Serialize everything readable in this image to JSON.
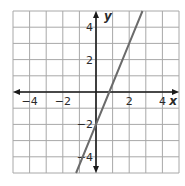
{
  "chart_data": {
    "type": "line",
    "title": "",
    "xlabel": "x",
    "ylabel": "y",
    "xlim": [
      -5,
      5
    ],
    "ylim": [
      -5,
      5
    ],
    "grid": true,
    "x_ticks": [
      -4,
      -2,
      2,
      4
    ],
    "y_ticks": [
      4,
      2,
      -2,
      -4
    ],
    "x_tick_labels": [
      "−4",
      "−2",
      "2",
      "4"
    ],
    "y_tick_labels": [
      "4",
      "2",
      "−2",
      "−4"
    ],
    "series": [
      {
        "name": "line",
        "equation": "y = 2.5x - 2",
        "slope": 2.5,
        "intercept": -2,
        "x": [
          -1.2,
          0,
          0.8,
          2,
          2.8
        ],
        "y": [
          -5,
          -2,
          0,
          3,
          5
        ],
        "color": "#6b6b6b"
      }
    ],
    "colors": {
      "grid": "#a8a8a8",
      "axes": "#1a1a1a",
      "line": "#6b6b6b"
    }
  }
}
